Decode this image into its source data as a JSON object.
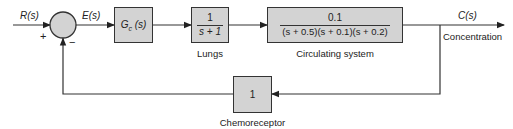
{
  "diagram": {
    "type": "closed-loop block diagram",
    "signals": {
      "input": "R(s)",
      "error": "E(s)",
      "output": "C(s)"
    },
    "summing_junction": {
      "plus_sign": "+",
      "minus_sign": "−"
    },
    "blocks": {
      "controller": {
        "label": "G",
        "subscript": "c",
        "arg": "(s)"
      },
      "lungs": {
        "numerator": "1",
        "denominator": "s + 1",
        "caption": "Lungs"
      },
      "circulating": {
        "numerator": "0.1",
        "denominator": "(s + 0.5)(s + 0.1)(s + 0.2)",
        "caption": "Circulating system"
      },
      "chemoreceptor": {
        "value": "1",
        "caption": "Chemoreceptor"
      }
    },
    "output_caption": "Concentration"
  },
  "colors": {
    "block_fill": "#d3d3d3",
    "line": "#333333",
    "background": "#ffffff"
  }
}
